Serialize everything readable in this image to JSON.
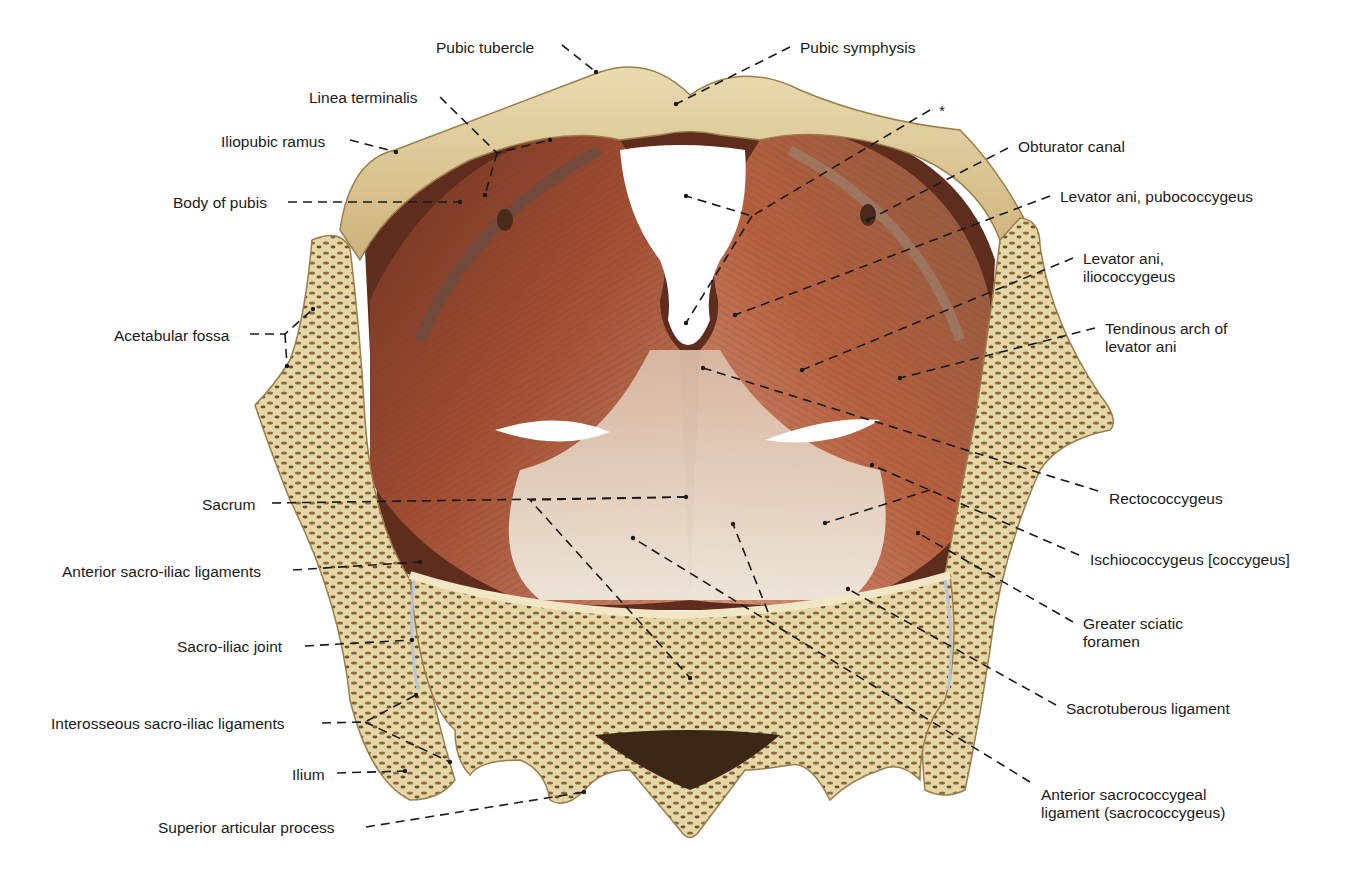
{
  "figure": {
    "type": "anatomical-illustration",
    "colors": {
      "bone": "#e3cf9a",
      "bone_dark": "#c9ad6e",
      "cancellous": "#8a6a3a",
      "muscle": "#b0583a",
      "muscle_dark": "#7e3a24",
      "tendon": "#e8dfd0",
      "leader_line": "#1a1a1a",
      "label_text": "#1a1a1a",
      "background": "#ffffff"
    }
  },
  "labels": {
    "left": [
      {
        "id": "pubic-tubercle",
        "text": "Pubic tubercle",
        "x": 436,
        "y": 39
      },
      {
        "id": "linea-terminalis",
        "text": "Linea terminalis",
        "x": 309,
        "y": 89
      },
      {
        "id": "iliopubic-ramus",
        "text": "Iliopubic ramus",
        "x": 221,
        "y": 133
      },
      {
        "id": "body-of-pubis",
        "text": "Body of pubis",
        "x": 173,
        "y": 194
      },
      {
        "id": "acetabular-fossa",
        "text": "Acetabular fossa",
        "x": 114,
        "y": 327
      },
      {
        "id": "sacrum",
        "text": "Sacrum",
        "x": 202,
        "y": 496
      },
      {
        "id": "anterior-sacro-iliac-ligaments",
        "text": "Anterior sacro-iliac ligaments",
        "x": 62,
        "y": 563
      },
      {
        "id": "sacro-iliac-joint",
        "text": "Sacro-iliac joint",
        "x": 177,
        "y": 638
      },
      {
        "id": "interosseous-sacro-iliac-ligaments",
        "text": "Interosseous sacro-iliac ligaments",
        "x": 51,
        "y": 715
      },
      {
        "id": "ilium",
        "text": "Ilium",
        "x": 292,
        "y": 766
      },
      {
        "id": "superior-articular-process",
        "text": "Superior articular process",
        "x": 158,
        "y": 819
      }
    ],
    "right": [
      {
        "id": "pubic-symphysis",
        "text": "Pubic symphysis",
        "x": 800,
        "y": 39
      },
      {
        "id": "asterisk",
        "text": "*",
        "x": 939,
        "y": 102
      },
      {
        "id": "obturator-canal",
        "text": "Obturator canal",
        "x": 1018,
        "y": 138
      },
      {
        "id": "levator-ani-pubococcygeus",
        "text": "Levator ani, pubococcygeus",
        "x": 1060,
        "y": 188
      },
      {
        "id": "levator-ani-iliococcygeus",
        "text": "Levator ani,\niliococcygeus",
        "x": 1083,
        "y": 250
      },
      {
        "id": "tendinous-arch-of-levator-ani",
        "text": "Tendinous arch of\nlevator ani",
        "x": 1105,
        "y": 320
      },
      {
        "id": "rectococcygeus",
        "text": "Rectococcygeus",
        "x": 1109,
        "y": 490
      },
      {
        "id": "ischiococcygeus",
        "text": "Ischiococcygeus [coccygeus]",
        "x": 1090,
        "y": 551
      },
      {
        "id": "greater-sciatic-foramen",
        "text": "Greater sciatic\nforamen",
        "x": 1083,
        "y": 615
      },
      {
        "id": "sacrotuberous-ligament",
        "text": "Sacrotuberous ligament",
        "x": 1066,
        "y": 700
      },
      {
        "id": "anterior-sacrococcygeal-ligament",
        "text": "Anterior sacrococcygeal\nligament (sacrococcygeus)",
        "x": 1041,
        "y": 786
      }
    ]
  },
  "leaders": [
    {
      "for": "pubic-tubercle",
      "points": [
        [
          562,
          45
        ],
        [
          596,
          72
        ]
      ]
    },
    {
      "for": "linea-terminalis",
      "points": [
        [
          440,
          97
        ],
        [
          497,
          153
        ],
        [
          550,
          140
        ]
      ]
    },
    {
      "for": "linea-terminalis",
      "points": [
        [
          497,
          153
        ],
        [
          485,
          195
        ]
      ]
    },
    {
      "for": "iliopubic-ramus",
      "points": [
        [
          350,
          140
        ],
        [
          396,
          152
        ]
      ]
    },
    {
      "for": "body-of-pubis",
      "points": [
        [
          288,
          202
        ],
        [
          460,
          202
        ]
      ]
    },
    {
      "for": "acetabular-fossa",
      "points": [
        [
          250,
          334
        ],
        [
          285,
          334
        ],
        [
          313,
          309
        ]
      ]
    },
    {
      "for": "acetabular-fossa",
      "points": [
        [
          285,
          334
        ],
        [
          287,
          366
        ]
      ]
    },
    {
      "for": "sacrum",
      "points": [
        [
          272,
          503
        ],
        [
          686,
          497
        ]
      ]
    },
    {
      "for": "anterior-sacro-iliac-ligaments",
      "points": [
        [
          293,
          570
        ],
        [
          420,
          562
        ]
      ]
    },
    {
      "for": "sacro-iliac-joint",
      "points": [
        [
          305,
          646
        ],
        [
          412,
          640
        ]
      ]
    },
    {
      "for": "interosseous-sacro-iliac-ligaments",
      "points": [
        [
          322,
          723
        ],
        [
          365,
          722
        ],
        [
          416,
          695
        ]
      ]
    },
    {
      "for": "interosseous-sacro-iliac-ligaments",
      "points": [
        [
          365,
          722
        ],
        [
          450,
          762
        ]
      ]
    },
    {
      "for": "ilium",
      "points": [
        [
          337,
          773
        ],
        [
          405,
          771
        ]
      ]
    },
    {
      "for": "superior-articular-process",
      "points": [
        [
          366,
          827
        ],
        [
          584,
          792
        ]
      ]
    },
    {
      "for": "pubic-symphysis",
      "points": [
        [
          790,
          47
        ],
        [
          676,
          104
        ]
      ]
    },
    {
      "for": "asterisk",
      "points": [
        [
          930,
          110
        ],
        [
          752,
          216
        ],
        [
          686,
          196
        ]
      ]
    },
    {
      "for": "asterisk",
      "points": [
        [
          752,
          216
        ],
        [
          686,
          323
        ]
      ]
    },
    {
      "for": "obturator-canal",
      "points": [
        [
          1008,
          148
        ],
        [
          868,
          220
        ]
      ]
    },
    {
      "for": "levator-ani-pubococcygeus",
      "points": [
        [
          1050,
          196
        ],
        [
          735,
          315
        ]
      ]
    },
    {
      "for": "levator-ani-iliococcygeus",
      "points": [
        [
          1073,
          258
        ],
        [
          802,
          370
        ]
      ]
    },
    {
      "for": "tendinous-arch-of-levator-ani",
      "points": [
        [
          1095,
          328
        ],
        [
          900,
          378
        ]
      ]
    },
    {
      "for": "rectococcygeus",
      "points": [
        [
          1098,
          491
        ],
        [
          703,
          368
        ]
      ]
    },
    {
      "for": "ischiococcygeus",
      "points": [
        [
          1079,
          555
        ],
        [
          872,
          465
        ]
      ]
    },
    {
      "for": "ischiococcygeus",
      "points": [
        [
          930,
          490
        ],
        [
          825,
          523
        ]
      ]
    },
    {
      "for": "greater-sciatic-foramen",
      "points": [
        [
          1073,
          622
        ],
        [
          918,
          533
        ]
      ]
    },
    {
      "for": "sacrotuberous-ligament",
      "points": [
        [
          1056,
          705
        ],
        [
          848,
          589
        ]
      ]
    },
    {
      "for": "anterior-sacrococcygeal-ligament",
      "points": [
        [
          1030,
          782
        ],
        [
          633,
          538
        ]
      ]
    },
    {
      "for": "anterior-sacrococcygeal-ligament",
      "points": [
        [
          768,
          612
        ],
        [
          733,
          524
        ]
      ]
    },
    {
      "for": "sacrum",
      "points": [
        [
          686,
          497
        ],
        [
          530,
          500
        ],
        [
          690,
          678
        ]
      ]
    }
  ]
}
